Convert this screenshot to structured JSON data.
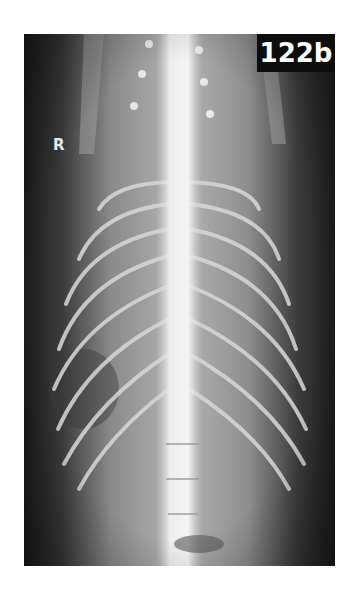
{
  "figure": {
    "label": "122b",
    "side_marker": "R",
    "colors": {
      "background": "#ffffff",
      "film_dark": "#1a1a1a",
      "badge_bg": "#0d0d0d",
      "badge_text": "#ffffff"
    }
  }
}
